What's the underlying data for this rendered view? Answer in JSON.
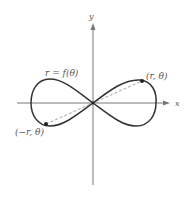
{
  "figure": {
    "axes": {
      "x_label": "x",
      "y_label": "y",
      "origin": [
        93,
        103
      ]
    },
    "curve": {
      "label": "r = f(θ)",
      "type": "lemniscate-like figure eight",
      "stroke_color": "#333333"
    },
    "points": [
      {
        "label": "(r, θ)",
        "position": [
          142,
          81
        ]
      },
      {
        "label": "(−r, θ)",
        "position": [
          46,
          124
        ]
      }
    ],
    "dashed_line": {
      "from": [
        46,
        124
      ],
      "to": [
        142,
        81
      ],
      "color": "#999999"
    },
    "colors": {
      "axis": "#777777",
      "curve": "#333333",
      "text": "#555555",
      "dash": "#999999"
    }
  }
}
